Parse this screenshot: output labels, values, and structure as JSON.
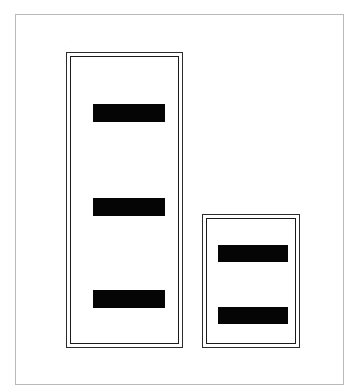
{
  "document": {
    "kind": "scanned-redacted-form",
    "page_background": "#ffffff",
    "frame_color": "#b9b9b9",
    "rule_color": "#1a1a1a",
    "redaction_color": "#050505",
    "canvas": {
      "width": 361,
      "height": 390
    }
  },
  "page_frame": {
    "label": "page border",
    "x": 15,
    "y": 14,
    "width": 329,
    "height": 371
  },
  "panels": [
    {
      "id": "panel-large",
      "label": "Large redaction panel",
      "x": 66,
      "y": 52,
      "width": 117,
      "height": 296,
      "border_style": "double-rule",
      "bar_count": "3",
      "bars": [
        {
          "id": "bar-large-1",
          "label": "Redacted line 1",
          "x": 25,
          "y": 50,
          "width": 72,
          "height": 18
        },
        {
          "id": "bar-large-2",
          "label": "Redacted line 2",
          "x": 25,
          "y": 144,
          "width": 72,
          "height": 18
        },
        {
          "id": "bar-large-3",
          "label": "Redacted line 3",
          "x": 25,
          "y": 236,
          "width": 72,
          "height": 18
        }
      ]
    },
    {
      "id": "panel-small",
      "label": "Small redaction panel",
      "x": 202,
      "y": 214,
      "width": 98,
      "height": 134,
      "border_style": "double-rule",
      "bar_count": "2",
      "bars": [
        {
          "id": "bar-small-1",
          "label": "Redacted line 1",
          "x": 14,
          "y": 29,
          "width": 70,
          "height": 17
        },
        {
          "id": "bar-small-2",
          "label": "Redacted line 2",
          "x": 14,
          "y": 91,
          "width": 70,
          "height": 17
        }
      ]
    }
  ]
}
